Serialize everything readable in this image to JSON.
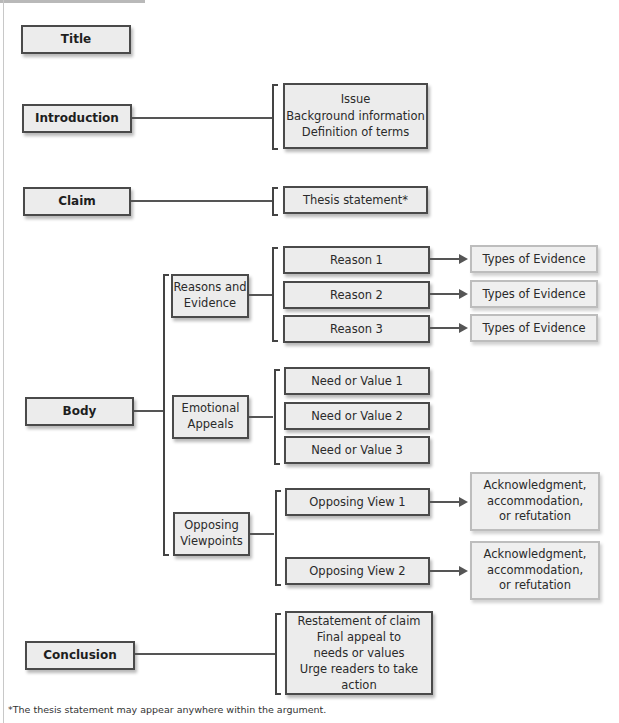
{
  "diagram": {
    "sections": {
      "title": "Title",
      "introduction": "Introduction",
      "claim": "Claim",
      "body": "Body",
      "conclusion": "Conclusion"
    },
    "introduction_items": [
      "Issue",
      "Background information",
      "Definition of terms"
    ],
    "claim_items": [
      "Thesis statement*"
    ],
    "body_groups": {
      "reasons": {
        "label_lines": [
          "Reasons and",
          "Evidence"
        ],
        "items": [
          "Reason 1",
          "Reason 2",
          "Reason 3"
        ],
        "outcomes": [
          "Types of Evidence",
          "Types of Evidence",
          "Types of Evidence"
        ]
      },
      "emotional": {
        "label_lines": [
          "Emotional",
          "Appeals"
        ],
        "items": [
          "Need or Value 1",
          "Need or Value 2",
          "Need or Value 3"
        ]
      },
      "opposing": {
        "label_lines": [
          "Opposing",
          "Viewpoints"
        ],
        "items": [
          "Opposing View 1",
          "Opposing View 2"
        ],
        "outcomes": [
          [
            "Acknowledgment,",
            "accommodation,",
            "or refutation"
          ],
          [
            "Acknowledgment,",
            "accommodation,",
            "or refutation"
          ]
        ]
      }
    },
    "conclusion_items": [
      "Restatement of claim",
      "Final appeal to",
      "needs or values",
      "Urge readers to take action"
    ],
    "footnote": "*The thesis statement may appear anywhere within the argument."
  }
}
